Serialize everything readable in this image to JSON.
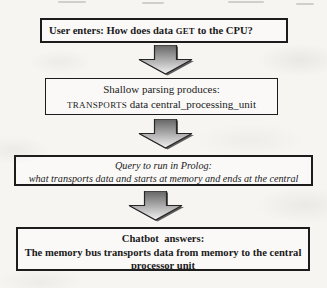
{
  "figure": {
    "background_color": "#f6f5f2",
    "box_border_color": "#1c1c1c",
    "text_color": "#1a1a1a",
    "arrow_colors": {
      "gradient_top": "#646464",
      "gradient_bottom": "#f2f2f2",
      "outline": "#262626",
      "shadow": "#3a3a3a"
    },
    "steps": [
      {
        "name": "user-input",
        "line1_prefix": "User enters: How does data ",
        "line1_smallcaps": "GET",
        "line1_suffix": " to the CPU?"
      },
      {
        "name": "shallow-parsing",
        "line1": "Shallow parsing produces:",
        "line2_smallcaps": "TRANSPORTS",
        "line2_rest": " data central_processing_unit"
      },
      {
        "name": "prolog-query",
        "line1": "Query to run in Prolog:",
        "line2": "what transports data and starts at memory and ends at the central",
        "line3_clipped": "processing_unit?"
      },
      {
        "name": "chatbot-answer",
        "line1": "Chatbot  answers:",
        "line2": "The memory bus transports data from memory to the central",
        "line3": "processor unit"
      }
    ]
  }
}
